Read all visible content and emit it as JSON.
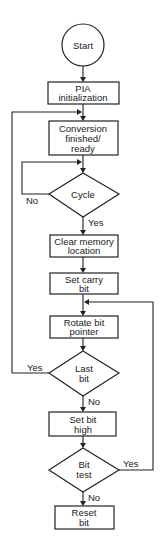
{
  "diagram": {
    "type": "flowchart",
    "nodes": [
      {
        "id": "start",
        "shape": "terminal",
        "lines": [
          "Start"
        ]
      },
      {
        "id": "pia_init",
        "shape": "process",
        "lines": [
          "PIA",
          "initialization"
        ]
      },
      {
        "id": "conversion",
        "shape": "process",
        "lines": [
          "Conversion",
          "finished/",
          "ready"
        ]
      },
      {
        "id": "cycle",
        "shape": "decision",
        "lines": [
          "Cycle"
        ]
      },
      {
        "id": "clear_memory",
        "shape": "process",
        "lines": [
          "Clear memory",
          "location"
        ]
      },
      {
        "id": "set_carry",
        "shape": "process",
        "lines": [
          "Set carry",
          "bit"
        ]
      },
      {
        "id": "rotate",
        "shape": "process",
        "lines": [
          "Rotate bit",
          "pointer"
        ]
      },
      {
        "id": "last_bit",
        "shape": "decision",
        "lines": [
          "Last",
          "bit"
        ]
      },
      {
        "id": "set_high",
        "shape": "process",
        "lines": [
          "Set bit",
          "high"
        ]
      },
      {
        "id": "bit_test",
        "shape": "decision",
        "lines": [
          "Bit",
          "test"
        ]
      },
      {
        "id": "reset_bit",
        "shape": "process",
        "lines": [
          "Reset",
          "bit"
        ]
      }
    ],
    "edges": [
      {
        "from": "start",
        "to": "pia_init",
        "label": ""
      },
      {
        "from": "pia_init",
        "to": "conversion",
        "label": ""
      },
      {
        "from": "conversion",
        "to": "cycle",
        "label": ""
      },
      {
        "from": "cycle",
        "to": "cycle",
        "label": "No"
      },
      {
        "from": "cycle",
        "to": "clear_memory",
        "label": "Yes"
      },
      {
        "from": "clear_memory",
        "to": "set_carry",
        "label": ""
      },
      {
        "from": "set_carry",
        "to": "rotate",
        "label": ""
      },
      {
        "from": "rotate",
        "to": "last_bit",
        "label": ""
      },
      {
        "from": "last_bit",
        "to": "conversion",
        "label": "Yes"
      },
      {
        "from": "last_bit",
        "to": "set_high",
        "label": "No"
      },
      {
        "from": "set_high",
        "to": "bit_test",
        "label": ""
      },
      {
        "from": "bit_test",
        "to": "rotate",
        "label": "Yes"
      },
      {
        "from": "bit_test",
        "to": "reset_bit",
        "label": "No"
      }
    ],
    "edge_labels": {
      "cycle_no": "No",
      "cycle_yes": "Yes",
      "last_bit_yes": "Yes",
      "last_bit_no": "No",
      "bit_test_yes": "Yes",
      "bit_test_no": "No"
    }
  }
}
